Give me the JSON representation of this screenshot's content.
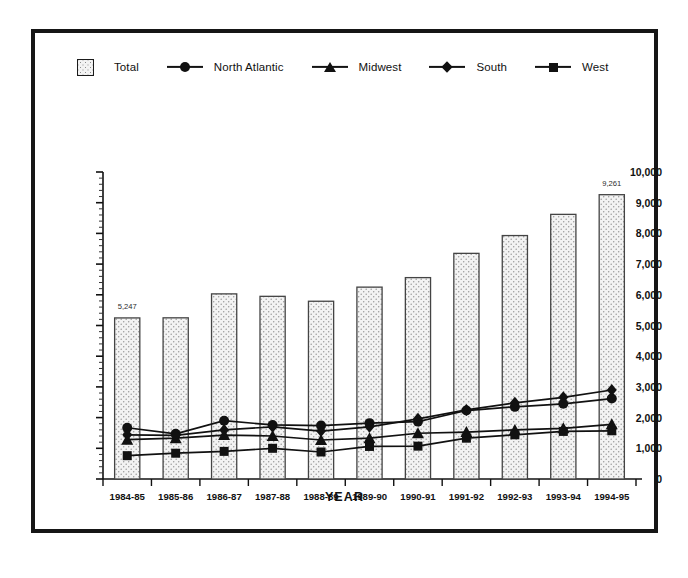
{
  "figure": {
    "axis_title_x": "YEAR",
    "frame_color": "#161616",
    "background": "#ffffff"
  },
  "legend": {
    "items": [
      {
        "label": "Total",
        "key": "swatch",
        "icon": "bar-swatch-icon"
      },
      {
        "label": "North Atlantic",
        "key": "circle",
        "icon": "circle-marker-icon"
      },
      {
        "label": "Midwest",
        "key": "triangle",
        "icon": "triangle-marker-icon"
      },
      {
        "label": "South",
        "key": "diamond",
        "icon": "diamond-marker-icon"
      },
      {
        "label": "West",
        "key": "square",
        "icon": "square-marker-icon"
      }
    ]
  },
  "chart_data": {
    "type": "bar",
    "title": "",
    "subtitle": "",
    "xlabel": "YEAR",
    "ylabel": "",
    "ylim": [
      0,
      10000
    ],
    "ytick_interval": 1000,
    "minor_ticks": true,
    "grid": false,
    "legend_position": "top-left",
    "categories": [
      "1984-85",
      "1985-86",
      "1986-87",
      "1987-88",
      "1988-89",
      "1989-90",
      "1990-91",
      "1991-92",
      "1992-93",
      "1993-94",
      "1994-95"
    ],
    "ytick_labels": [
      "0",
      "1,000",
      "2,000",
      "3,000",
      "4,000",
      "5,000",
      "6,000",
      "7,000",
      "8,000",
      "9,000",
      "10,000"
    ],
    "ytick_values": [
      0,
      1000,
      2000,
      3000,
      4000,
      5000,
      6000,
      7000,
      8000,
      9000,
      10000
    ],
    "bars": {
      "name": "Total",
      "style": "stippled-fill",
      "fill": "#f3f3f3",
      "edge": "#444444",
      "values": [
        5247,
        5250,
        6030,
        5950,
        5790,
        6250,
        6560,
        7350,
        7930,
        8620,
        9261
      ]
    },
    "bar_annotations": [
      {
        "category": "1984-85",
        "value": 5247,
        "text": "5,247"
      },
      {
        "category": "1994-95",
        "value": 9261,
        "text": "9,261"
      }
    ],
    "series": [
      {
        "name": "North Atlantic",
        "marker": "circle",
        "color": "#111111",
        "values": [
          1670,
          1470,
          1900,
          1760,
          1740,
          1820,
          1870,
          2230,
          2350,
          2450,
          2620
        ]
      },
      {
        "name": "Midwest",
        "marker": "triangle",
        "color": "#111111",
        "values": [
          1280,
          1330,
          1430,
          1400,
          1270,
          1330,
          1490,
          1530,
          1600,
          1650,
          1780
        ]
      },
      {
        "name": "South",
        "marker": "diamond",
        "color": "#111111",
        "values": [
          1440,
          1420,
          1600,
          1700,
          1560,
          1700,
          1960,
          2250,
          2480,
          2660,
          2900
        ]
      },
      {
        "name": "West",
        "marker": "square",
        "color": "#111111",
        "values": [
          760,
          840,
          900,
          1000,
          880,
          1060,
          1070,
          1330,
          1440,
          1550,
          1570
        ]
      }
    ]
  }
}
